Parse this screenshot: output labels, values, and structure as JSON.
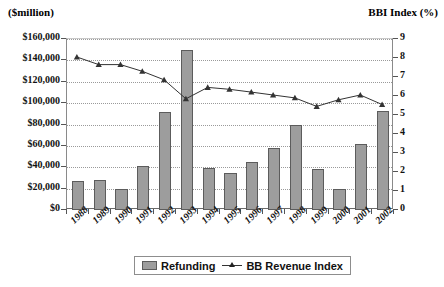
{
  "chart_data": {
    "type": "bar",
    "title": "",
    "left_axis_title": "($million)",
    "right_axis_title": "BBI Index (%)",
    "xlabel": "",
    "grid": true,
    "legend_position": "bottom",
    "categories": [
      "1988",
      "1989",
      "1990",
      "1991",
      "1992",
      "1993",
      "1994",
      "1995",
      "1996",
      "1997",
      "1998",
      "1999",
      "2000",
      "2001",
      "2002"
    ],
    "ylim": [
      0,
      160000
    ],
    "yticks": [
      0,
      20000,
      40000,
      60000,
      80000,
      100000,
      120000,
      140000,
      160000
    ],
    "ytick_labels": [
      "$0",
      "$20,000",
      "$40,000",
      "$60,000",
      "$80,000",
      "$100,000",
      "$120,000",
      "$140,000",
      "$160,000"
    ],
    "y2lim": [
      0,
      9
    ],
    "y2ticks": [
      0,
      1,
      2,
      3,
      4,
      5,
      6,
      7,
      8,
      9
    ],
    "y2tick_labels": [
      "0",
      "1",
      "2",
      "3",
      "4",
      "5",
      "6",
      "7",
      "8",
      "9"
    ],
    "series": [
      {
        "name": "Refunding",
        "type": "bar",
        "axis": "left",
        "color": "#9d9d9d",
        "values": [
          27000,
          28000,
          20000,
          41000,
          92000,
          150000,
          39000,
          35000,
          45000,
          58000,
          80000,
          38000,
          20000,
          62000,
          93000
        ]
      },
      {
        "name": "BB Revenue Index",
        "type": "line",
        "axis": "right",
        "color": "#333333",
        "marker": "triangle",
        "values": [
          8.0,
          7.6,
          7.6,
          7.25,
          6.8,
          5.8,
          6.4,
          6.3,
          6.15,
          6.0,
          5.85,
          5.4,
          5.75,
          6.0,
          5.5
        ]
      }
    ]
  },
  "legend": {
    "items": [
      {
        "label": "Refunding",
        "marker": "bar-swatch"
      },
      {
        "label": "BB Revenue Index",
        "marker": "line-triangle"
      }
    ]
  },
  "colors": {
    "bar_fill": "#9d9d9d",
    "bar_border": "#5c5c5c",
    "line": "#333333",
    "grid": "#9a9a9a",
    "axis": "#6a6a6a",
    "background": "#ffffff"
  }
}
